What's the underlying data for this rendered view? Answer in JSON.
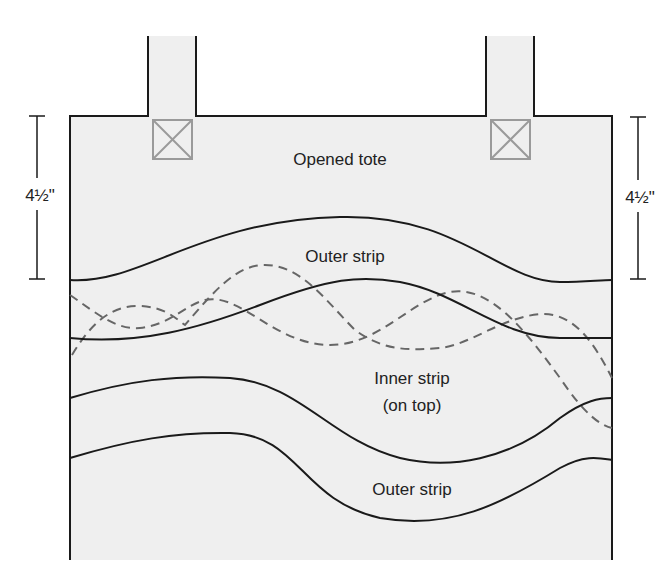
{
  "diagram": {
    "title": "Opened tote",
    "colors": {
      "background": "#ffffff",
      "fabric": "#efefef",
      "outline": "#1a1a1a",
      "dashed": "#666666",
      "handle_box": "#9a9a9a",
      "text": "#222222"
    },
    "labels": {
      "opened_tote": "Opened tote",
      "outer_strip_top": "Outer strip",
      "inner_strip_line1": "Inner strip",
      "inner_strip_line2": "(on top)",
      "outer_strip_bottom": "Outer strip"
    },
    "dimensions": {
      "left": "4½\"",
      "right": "4½\""
    },
    "handles": [
      {
        "name": "left-handle",
        "marker": "x-box"
      },
      {
        "name": "right-handle",
        "marker": "x-box"
      }
    ]
  }
}
